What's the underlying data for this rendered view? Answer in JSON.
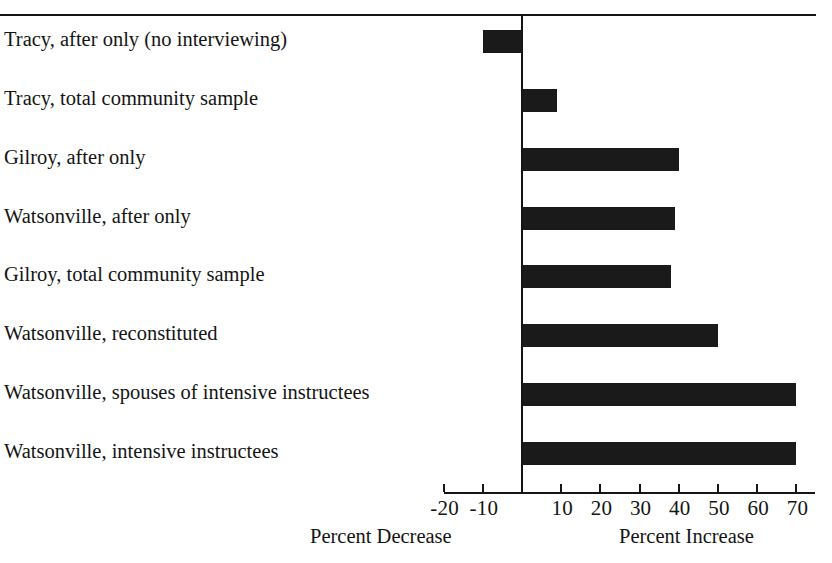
{
  "chart_data": {
    "type": "bar",
    "orientation": "horizontal",
    "title": "",
    "subtitle": "",
    "xlabel": "",
    "ylabel": "",
    "xlim": [
      -20,
      70
    ],
    "grid": false,
    "legend": null,
    "zero_reference_line": true,
    "axis_left_caption": "Percent Decrease",
    "axis_right_caption": "Percent Increase",
    "xticks": [
      -20,
      -10,
      0,
      10,
      20,
      30,
      40,
      50,
      60,
      70
    ],
    "xticklabels": [
      "-20",
      "-10",
      "",
      "10",
      "20",
      "30",
      "40",
      "50",
      "60",
      "70"
    ],
    "categories": [
      "Tracy, after only (no interviewing)",
      "Tracy, total community sample",
      "Gilroy, after only",
      "Watsonville, after only",
      "Gilroy, total community sample",
      "Watsonville, reconstituted",
      "Watsonville, spouses of intensive instructees",
      "Watsonville, intensive instructees"
    ],
    "values": [
      -10,
      9,
      40,
      39,
      38,
      50,
      70,
      70
    ],
    "bar_color": "#1a1a1a"
  },
  "axis": {
    "ticks": [
      {
        "value": -20,
        "label": "-20"
      },
      {
        "value": -10,
        "label": "-10"
      },
      {
        "value": 0,
        "label": ""
      },
      {
        "value": 10,
        "label": "10"
      },
      {
        "value": 20,
        "label": "20"
      },
      {
        "value": 30,
        "label": "30"
      },
      {
        "value": 40,
        "label": "40"
      },
      {
        "value": 50,
        "label": "50"
      },
      {
        "value": 60,
        "label": "60"
      },
      {
        "value": 70,
        "label": "70"
      }
    ],
    "caption_left": "Percent Decrease",
    "caption_right": "Percent Increase"
  },
  "rows": [
    {
      "label": "Tracy, after only (no interviewing)",
      "value": -10
    },
    {
      "label": "Tracy, total community sample",
      "value": 9
    },
    {
      "label": "Gilroy, after only",
      "value": 40
    },
    {
      "label": "Watsonville, after only",
      "value": 39
    },
    {
      "label": "Gilroy, total community sample",
      "value": 38
    },
    {
      "label": "Watsonville, reconstituted",
      "value": 50
    },
    {
      "label": "Watsonville, spouses of intensive instructees",
      "value": 70
    },
    {
      "label": "Watsonville, intensive instructees",
      "value": 70
    }
  ],
  "colors": {
    "bar": "#1a1a1a",
    "axis": "#151515",
    "text": "#141414",
    "background": "#ffffff"
  }
}
